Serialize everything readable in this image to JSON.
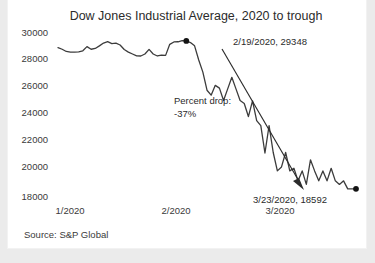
{
  "card": {
    "background": "#ffffff",
    "page_background": "#ebebeb"
  },
  "source": {
    "label": "Source: S&P Global"
  },
  "chart_data": {
    "type": "line",
    "title": "Dow Jones Industrial Average, 2020 to trough",
    "xlabel": "",
    "ylabel": "",
    "grid": false,
    "legend": "none",
    "line_color": "#3c3c3c",
    "ylim": [
      18000,
      30000
    ],
    "y_ticks": [
      "30000",
      "28000",
      "26000",
      "24000",
      "22000",
      "20000",
      "18000"
    ],
    "y_tick_values": [
      30000,
      28000,
      26000,
      24000,
      22000,
      20000,
      18000
    ],
    "x_ticks": [
      "1/2020",
      "2/2020",
      "3/2020"
    ],
    "x_tick_positions": [
      0,
      33,
      66
    ],
    "series": [
      {
        "name": "Dow Jones Industrial Average",
        "x": [
          0,
          1,
          2,
          3,
          4,
          5,
          6,
          7,
          8,
          9,
          10,
          11,
          12,
          13,
          14,
          15,
          16,
          17,
          18,
          19,
          20,
          21,
          22,
          23,
          24,
          25,
          26,
          27,
          28,
          29,
          30,
          31,
          32,
          33,
          34,
          35,
          36,
          37,
          38,
          39,
          40,
          41,
          42,
          43,
          44,
          45,
          46,
          47,
          48,
          49,
          50,
          51,
          52,
          53,
          54,
          55,
          56,
          57,
          58,
          59,
          60,
          61,
          62,
          63,
          64,
          65,
          66,
          67,
          68,
          69,
          70,
          71,
          72
        ],
        "values": [
          28868,
          28745,
          28583,
          28539,
          28538,
          28556,
          28634,
          28939,
          28745,
          28804,
          28989,
          29196,
          29297,
          29160,
          29186,
          29056,
          28723,
          28536,
          28400,
          28260,
          28256,
          28399,
          28735,
          28400,
          28256,
          28320,
          28300,
          29102,
          29276,
          29290,
          29379,
          29348,
          29232,
          28992,
          27960,
          27081,
          25766,
          25409,
          26121,
          25917,
          25018,
          25864,
          26703,
          25864,
          25018,
          24800,
          23851,
          24995,
          23553,
          23185,
          21200,
          23185,
          21237,
          19899,
          20188,
          21237,
          19899,
          20087,
          19174,
          19899,
          18917,
          20704,
          19899,
          19174,
          19898,
          19173,
          20087,
          19174,
          18917,
          19173,
          18592,
          18592,
          18592
        ]
      }
    ],
    "annotations": [
      {
        "id": "peak",
        "label": "2/19/2020, 29348",
        "date": "2/19/2020",
        "value": 29348,
        "marker": "diamond"
      },
      {
        "id": "trough",
        "label": "3/23/2020, 18592",
        "date": "3/23/2020",
        "value": 18592,
        "marker": "diamond"
      },
      {
        "id": "drop",
        "label_line1": "Percent drop:",
        "label_line2": "-37%",
        "value": "-37%"
      }
    ]
  }
}
